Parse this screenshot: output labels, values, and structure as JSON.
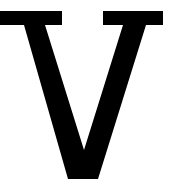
{
  "image": {
    "kind": "glyph-specimen",
    "character": "V",
    "character_name": "latin-capital-letter-v",
    "style": "serif",
    "weight": "bold",
    "case": "uppercase",
    "ink_color": "#000000",
    "background_color": "#ffffff",
    "canvas_width": 169,
    "canvas_height": 190
  },
  "geometry": {
    "left_serif": {
      "x_start": 0,
      "x_end": 62,
      "y_top": 11,
      "y_bottom": 25
    },
    "right_serif": {
      "x_start": 103,
      "x_end": 163,
      "y_top": 11,
      "y_bottom": 25
    },
    "vertex": {
      "x_start": 68,
      "x_end": 98,
      "y": 179
    },
    "thick_stroke_width": 26,
    "thin_stroke_width": 13,
    "cap_height_top": 11,
    "baseline": 179,
    "outline": "M 0,11 L 62,11 L 62,25 L 45,25 L 84,150 L 123,25 L 103,25 L 103,11 L 163,11 L 163,25 L 146,25 L 98,179 L 68,179 L 24,25 L 0,25 Z"
  },
  "caption": {
    "text": "V"
  }
}
